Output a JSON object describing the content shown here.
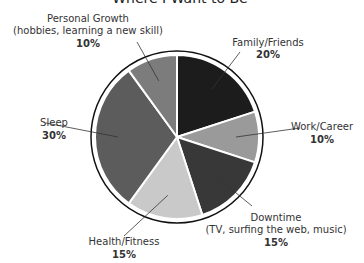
{
  "chart_data": {
    "type": "pie",
    "title": "Where I Want to Be",
    "start": "top",
    "direction": "clockwise",
    "slices": [
      {
        "name": "Family/Friends",
        "sub": "",
        "value": 20,
        "label": "20%",
        "color": "#1c1c1c"
      },
      {
        "name": "Work/Career",
        "sub": "",
        "value": 10,
        "label": "10%",
        "color": "#9a9a9a"
      },
      {
        "name": "Downtime",
        "sub": "(TV, surfing the web, music)",
        "value": 15,
        "label": "15%",
        "color": "#383838"
      },
      {
        "name": "Health/Fitness",
        "sub": "",
        "value": 15,
        "label": "15%",
        "color": "#c9c9c9"
      },
      {
        "name": "Sleep",
        "sub": "",
        "value": 30,
        "label": "30%",
        "color": "#5c5c5c"
      },
      {
        "name": "Personal Growth",
        "sub": "(hobbies, learning a new skill)",
        "value": 10,
        "label": "10%",
        "color": "#7c7c7c"
      }
    ]
  }
}
